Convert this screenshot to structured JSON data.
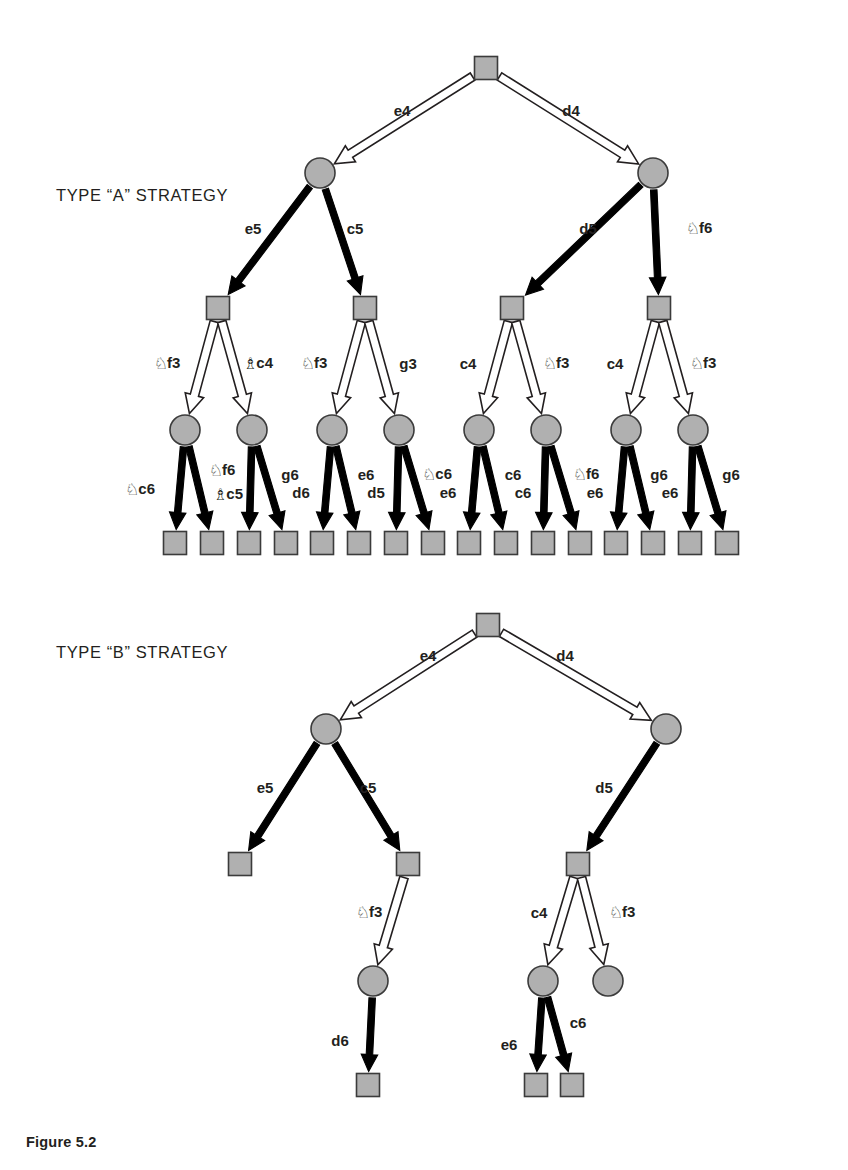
{
  "figure": {
    "caption": "Figure 5.2",
    "type_a_label": "TYPE “A” STRATEGY",
    "type_b_label": "TYPE “B” STRATEGY"
  },
  "colors": {
    "node_fill": "#b0b0b0",
    "node_stroke": "#3b3b3b",
    "white_arrow_fill": "#ffffff",
    "white_arrow_stroke": "#231f20",
    "black_arrow_fill": "#000000",
    "text": "#231f20",
    "background": "#ffffff"
  },
  "glyphs": {
    "knight": "♘",
    "bishop": "♗",
    "square_node": "square-node",
    "circle_node": "circle-node"
  },
  "legend": {
    "white_arrow_meaning": "White move (hollow arrow)",
    "black_arrow_meaning": "Black move (solid arrow)",
    "square_node_meaning": "Position with White to move",
    "circle_node_meaning": "Position with Black to move"
  },
  "type_a": {
    "name": "TYPE “A” STRATEGY",
    "root": {
      "id": "a-root",
      "shape": "square",
      "x": 486,
      "y": 68
    },
    "level1_moves": [
      {
        "id": "a-m1-1",
        "label": "e4",
        "piece": "",
        "side": "white",
        "from": "a-root",
        "to": "a-n1",
        "lx": 402,
        "ly": 110
      },
      {
        "id": "a-m1-2",
        "label": "d4",
        "piece": "",
        "side": "white",
        "from": "a-root",
        "to": "a-n2",
        "lx": 571,
        "ly": 110
      }
    ],
    "level1_nodes": [
      {
        "id": "a-n1",
        "shape": "circle",
        "x": 320,
        "y": 173
      },
      {
        "id": "a-n2",
        "shape": "circle",
        "x": 653,
        "y": 173
      }
    ],
    "level2_moves": [
      {
        "id": "a-m2-1",
        "label": "e5",
        "piece": "",
        "side": "black",
        "from": "a-n1",
        "to": "a-s1",
        "lx": 253,
        "ly": 228
      },
      {
        "id": "a-m2-2",
        "label": "c5",
        "piece": "",
        "side": "black",
        "from": "a-n1",
        "to": "a-s2",
        "lx": 355,
        "ly": 228
      },
      {
        "id": "a-m2-3",
        "label": "d5",
        "piece": "",
        "side": "black",
        "from": "a-n2",
        "to": "a-s3",
        "lx": 588,
        "ly": 228
      },
      {
        "id": "a-m2-4",
        "label": "f6",
        "piece": "knight",
        "side": "black",
        "from": "a-n2",
        "to": "a-s4",
        "lx": 699,
        "ly": 228
      }
    ],
    "level2_nodes": [
      {
        "id": "a-s1",
        "shape": "square",
        "x": 218,
        "y": 308
      },
      {
        "id": "a-s2",
        "shape": "square",
        "x": 365,
        "y": 308
      },
      {
        "id": "a-s3",
        "shape": "square",
        "x": 512,
        "y": 308
      },
      {
        "id": "a-s4",
        "shape": "square",
        "x": 659,
        "y": 308
      }
    ],
    "level3_moves": [
      {
        "id": "a-m3-1",
        "label": "f3",
        "piece": "knight",
        "side": "white",
        "from": "a-s1",
        "to": "a-c1",
        "lx": 167,
        "ly": 363
      },
      {
        "id": "a-m3-2",
        "label": "c4",
        "piece": "bishop",
        "side": "white",
        "from": "a-s1",
        "to": "a-c2",
        "lx": 258,
        "ly": 363
      },
      {
        "id": "a-m3-3",
        "label": "f3",
        "piece": "knight",
        "side": "white",
        "from": "a-s2",
        "to": "a-c3",
        "lx": 314,
        "ly": 363
      },
      {
        "id": "a-m3-4",
        "label": "g3",
        "piece": "",
        "side": "white",
        "from": "a-s2",
        "to": "a-c4",
        "lx": 408,
        "ly": 363
      },
      {
        "id": "a-m3-5",
        "label": "c4",
        "piece": "",
        "side": "white",
        "from": "a-s3",
        "to": "a-c5",
        "lx": 468,
        "ly": 363
      },
      {
        "id": "a-m3-6",
        "label": "f3",
        "piece": "knight",
        "side": "white",
        "from": "a-s3",
        "to": "a-c6",
        "lx": 556,
        "ly": 363
      },
      {
        "id": "a-m3-7",
        "label": "c4",
        "piece": "",
        "side": "white",
        "from": "a-s4",
        "to": "a-c7",
        "lx": 615,
        "ly": 363
      },
      {
        "id": "a-m3-8",
        "label": "f3",
        "piece": "knight",
        "side": "white",
        "from": "a-s4",
        "to": "a-c8",
        "lx": 703,
        "ly": 363
      }
    ],
    "level3_nodes": [
      {
        "id": "a-c1",
        "shape": "circle",
        "x": 185,
        "y": 430
      },
      {
        "id": "a-c2",
        "shape": "circle",
        "x": 252,
        "y": 430
      },
      {
        "id": "a-c3",
        "shape": "circle",
        "x": 332,
        "y": 430
      },
      {
        "id": "a-c4",
        "shape": "circle",
        "x": 399,
        "y": 430
      },
      {
        "id": "a-c5",
        "shape": "circle",
        "x": 479,
        "y": 430
      },
      {
        "id": "a-c6",
        "shape": "circle",
        "x": 546,
        "y": 430
      },
      {
        "id": "a-c7",
        "shape": "circle",
        "x": 626,
        "y": 430
      },
      {
        "id": "a-c8",
        "shape": "circle",
        "x": 693,
        "y": 430
      }
    ],
    "level4_moves": [
      {
        "id": "a-m4-1",
        "label": "c6",
        "piece": "knight",
        "side": "black",
        "from": "a-c1",
        "to": "a-l1",
        "lx": 140,
        "ly": 489
      },
      {
        "id": "a-m4-2",
        "label": "f6",
        "piece": "knight",
        "side": "black",
        "from": "a-c1",
        "to": "a-l2",
        "lx": 222,
        "ly": 470
      },
      {
        "id": "a-m4-3",
        "label": "c5",
        "piece": "bishop",
        "side": "black",
        "from": "a-c2",
        "to": "a-l3",
        "lx": 228,
        "ly": 494
      },
      {
        "id": "a-m4-4",
        "label": "g6",
        "piece": "",
        "side": "black",
        "from": "a-c2",
        "to": "a-l4",
        "lx": 290,
        "ly": 474
      },
      {
        "id": "a-m4-5",
        "label": "d6",
        "piece": "",
        "side": "black",
        "from": "a-c3",
        "to": "a-l5",
        "lx": 301,
        "ly": 492
      },
      {
        "id": "a-m4-6",
        "label": "e6",
        "piece": "",
        "side": "black",
        "from": "a-c3",
        "to": "a-l6",
        "lx": 366,
        "ly": 474
      },
      {
        "id": "a-m4-7",
        "label": "d5",
        "piece": "",
        "side": "black",
        "from": "a-c4",
        "to": "a-l7",
        "lx": 376,
        "ly": 492
      },
      {
        "id": "a-m4-8",
        "label": "c6",
        "piece": "knight",
        "side": "black",
        "from": "a-c4",
        "to": "a-l8",
        "lx": 437,
        "ly": 474
      },
      {
        "id": "a-m4-9",
        "label": "e6",
        "piece": "",
        "side": "black",
        "from": "a-c5",
        "to": "a-l9",
        "lx": 448,
        "ly": 492
      },
      {
        "id": "a-m4-10",
        "label": "c6",
        "piece": "",
        "side": "black",
        "from": "a-c5",
        "to": "a-l10",
        "lx": 513,
        "ly": 474
      },
      {
        "id": "a-m4-11",
        "label": "c6",
        "piece": "",
        "side": "black",
        "from": "a-c6",
        "to": "a-l11",
        "lx": 523,
        "ly": 492
      },
      {
        "id": "a-m4-12",
        "label": "f6",
        "piece": "knight",
        "side": "black",
        "from": "a-c6",
        "to": "a-l12",
        "lx": 586,
        "ly": 474
      },
      {
        "id": "a-m4-13",
        "label": "e6",
        "piece": "",
        "side": "black",
        "from": "a-c7",
        "to": "a-l13",
        "lx": 595,
        "ly": 492
      },
      {
        "id": "a-m4-14",
        "label": "g6",
        "piece": "",
        "side": "black",
        "from": "a-c7",
        "to": "a-l14",
        "lx": 659,
        "ly": 474
      },
      {
        "id": "a-m4-15",
        "label": "e6",
        "piece": "",
        "side": "black",
        "from": "a-c8",
        "to": "a-l15",
        "lx": 670,
        "ly": 492
      },
      {
        "id": "a-m4-16",
        "label": "g6",
        "piece": "",
        "side": "black",
        "from": "a-c8",
        "to": "a-l16",
        "lx": 731,
        "ly": 474
      }
    ],
    "leaves": [
      {
        "id": "a-l1",
        "shape": "square",
        "x": 175,
        "y": 543
      },
      {
        "id": "a-l2",
        "shape": "square",
        "x": 212,
        "y": 543
      },
      {
        "id": "a-l3",
        "shape": "square",
        "x": 249,
        "y": 543
      },
      {
        "id": "a-l4",
        "shape": "square",
        "x": 286,
        "y": 543
      },
      {
        "id": "a-l5",
        "shape": "square",
        "x": 322,
        "y": 543
      },
      {
        "id": "a-l6",
        "shape": "square",
        "x": 359,
        "y": 543
      },
      {
        "id": "a-l7",
        "shape": "square",
        "x": 396,
        "y": 543
      },
      {
        "id": "a-l8",
        "shape": "square",
        "x": 433,
        "y": 543
      },
      {
        "id": "a-l9",
        "shape": "square",
        "x": 469,
        "y": 543
      },
      {
        "id": "a-l10",
        "shape": "square",
        "x": 506,
        "y": 543
      },
      {
        "id": "a-l11",
        "shape": "square",
        "x": 543,
        "y": 543
      },
      {
        "id": "a-l12",
        "shape": "square",
        "x": 580,
        "y": 543
      },
      {
        "id": "a-l13",
        "shape": "square",
        "x": 616,
        "y": 543
      },
      {
        "id": "a-l14",
        "shape": "square",
        "x": 653,
        "y": 543
      },
      {
        "id": "a-l15",
        "shape": "square",
        "x": 690,
        "y": 543
      },
      {
        "id": "a-l16",
        "shape": "square",
        "x": 727,
        "y": 543
      }
    ]
  },
  "type_b": {
    "name": "TYPE “B” STRATEGY",
    "root": {
      "id": "b-root",
      "shape": "square",
      "x": 488,
      "y": 625
    },
    "level1_moves": [
      {
        "id": "b-m1-1",
        "label": "e4",
        "piece": "",
        "side": "white",
        "from": "b-root",
        "to": "b-n1",
        "lx": 428,
        "ly": 655
      },
      {
        "id": "b-m1-2",
        "label": "d4",
        "piece": "",
        "side": "white",
        "from": "b-root",
        "to": "b-n2",
        "lx": 565,
        "ly": 655
      }
    ],
    "level1_nodes": [
      {
        "id": "b-n1",
        "shape": "circle",
        "x": 326,
        "y": 729
      },
      {
        "id": "b-n2",
        "shape": "circle",
        "x": 666,
        "y": 729
      }
    ],
    "level2_moves": [
      {
        "id": "b-m2-1",
        "label": "e5",
        "piece": "",
        "side": "black",
        "from": "b-n1",
        "to": "b-s1",
        "lx": 265,
        "ly": 787
      },
      {
        "id": "b-m2-2",
        "label": "c5",
        "piece": "",
        "side": "black",
        "from": "b-n1",
        "to": "b-s2",
        "lx": 368,
        "ly": 787
      },
      {
        "id": "b-m2-3",
        "label": "d5",
        "piece": "",
        "side": "black",
        "from": "b-n2",
        "to": "b-s3",
        "lx": 604,
        "ly": 787
      }
    ],
    "level2_nodes": [
      {
        "id": "b-s1",
        "shape": "square",
        "x": 240,
        "y": 864
      },
      {
        "id": "b-s2",
        "shape": "square",
        "x": 408,
        "y": 864
      },
      {
        "id": "b-s3",
        "shape": "square",
        "x": 578,
        "y": 864
      }
    ],
    "level3_moves": [
      {
        "id": "b-m3-1",
        "label": "f3",
        "piece": "knight",
        "side": "white",
        "from": "b-s2",
        "to": "b-c1",
        "lx": 369,
        "ly": 912
      },
      {
        "id": "b-m3-2",
        "label": "c4",
        "piece": "",
        "side": "white",
        "from": "b-s3",
        "to": "b-c2",
        "lx": 539,
        "ly": 912
      },
      {
        "id": "b-m3-3",
        "label": "f3",
        "piece": "knight",
        "side": "white",
        "from": "b-s3",
        "to": "b-c3",
        "lx": 622,
        "ly": 912
      }
    ],
    "level3_nodes": [
      {
        "id": "b-c1",
        "shape": "circle",
        "x": 373,
        "y": 981
      },
      {
        "id": "b-c2",
        "shape": "circle",
        "x": 543,
        "y": 981
      },
      {
        "id": "b-c3",
        "shape": "circle",
        "x": 608,
        "y": 981
      }
    ],
    "level4_moves": [
      {
        "id": "b-m4-1",
        "label": "d6",
        "piece": "",
        "side": "black",
        "from": "b-c1",
        "to": "b-l1",
        "lx": 340,
        "ly": 1040
      },
      {
        "id": "b-m4-2",
        "label": "e6",
        "piece": "",
        "side": "black",
        "from": "b-c2",
        "to": "b-l2",
        "lx": 509,
        "ly": 1044
      },
      {
        "id": "b-m4-3",
        "label": "c6",
        "piece": "",
        "side": "black",
        "from": "b-c2",
        "to": "b-l3",
        "lx": 578,
        "ly": 1022
      }
    ],
    "leaves": [
      {
        "id": "b-l1",
        "shape": "square",
        "x": 368,
        "y": 1085
      },
      {
        "id": "b-l2",
        "shape": "square",
        "x": 536,
        "y": 1085
      },
      {
        "id": "b-l3",
        "shape": "square",
        "x": 572,
        "y": 1085
      }
    ]
  }
}
